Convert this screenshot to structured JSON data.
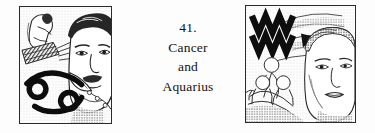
{
  "figure": {
    "background_color": "#fdfdfd",
    "ink_color": "#1a1a1a",
    "caption": {
      "number": "41.",
      "line_subject_a": "Cancer",
      "line_conjunction": "and",
      "line_subject_b": "Aquarius"
    },
    "panels": [
      {
        "id": "left",
        "position": "left",
        "border_color": "#2b2b2b",
        "description": "Line-art plate: man's face in three-quarter view with dark wavy hair and moustache, a crouching nude figure at upper left, hatched diagonal band, and the Cancer zodiac glyph at lower left",
        "zodiac_sign": "Cancer",
        "zodiac_glyph": "♋",
        "zodiac_glyph_position": "lower-left",
        "elements": [
          "mans-face",
          "crouching-figure",
          "hatched-band",
          "cancer-glyph"
        ]
      },
      {
        "id": "right",
        "position": "right",
        "border_color": "#2b2b2b",
        "description": "Line-art plate: woman's face in three-quarter view at right, group of bathing figures at lower left, and the Aquarius double-wave zodiac glyph at upper left",
        "zodiac_sign": "Aquarius",
        "zodiac_glyph": "♒",
        "zodiac_glyph_position": "upper-left",
        "elements": [
          "aquarius-glyph",
          "womans-face",
          "bathing-figures",
          "dark-wedge-shape"
        ]
      }
    ]
  }
}
